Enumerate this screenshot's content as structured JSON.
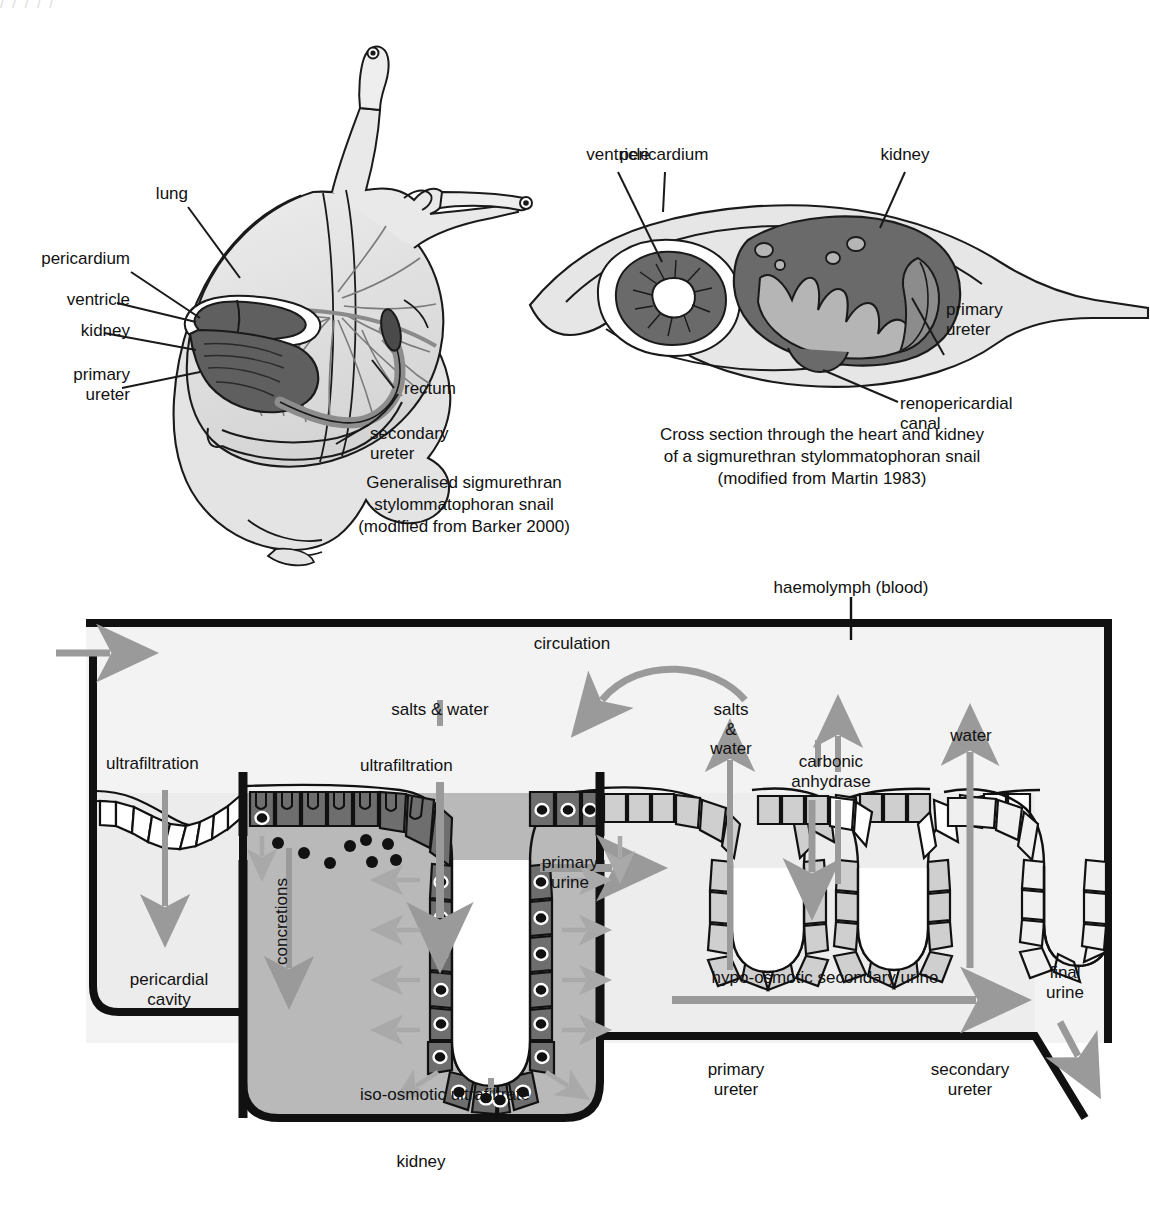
{
  "figure": {
    "title_fragment_top": "/ / / / /"
  },
  "panel_a": {
    "name": "Generalised sigmurethran stylommatophoran snail",
    "caption": "Generalised sigmurethran\nstylommatophoran snail\n(modified from Barker 2000)",
    "labels": {
      "lung": "lung",
      "pericardium": "pericardium",
      "ventricle": "ventricle",
      "kidney": "kidney",
      "primary_ureter": "primary\nureter",
      "rectum": "rectum",
      "secondary_ureter": "secondary\nureter"
    }
  },
  "panel_b": {
    "name": "Cross section through the heart and kidney",
    "caption": "Cross section through the heart and kidney\nof a sigmurethran stylommatophoran snail\n(modified from Martin 1983)",
    "labels": {
      "ventricle": "ventricle",
      "pericardium": "pericardium",
      "kidney": "kidney",
      "primary_ureter": "primary\nureter",
      "renopericardial_canal": "renopericardial\ncanal"
    }
  },
  "panel_c": {
    "name": "Urine formation schematic",
    "labels": {
      "haemolymph": "haemolymph (blood)",
      "circulation": "circulation",
      "salts_and_water_left": "salts & water",
      "ultrafiltration_left": "ultrafiltration",
      "ultrafiltration_mid": "ultrafiltration",
      "salts_and_water_right": "salts\n&\nwater",
      "carbonic_anhydrase": "carbonic\nanhydrase",
      "water": "water",
      "concretions": "concretions",
      "primary_urine": "primary\nurine",
      "pericardial_cavity": "pericardial\ncavity",
      "iso_osmotic_ultrafiltrate": "iso-osmotic ultrafiltrate",
      "kidney": "kidney",
      "hypo_osmotic_secondary_urine": "hypo-osmotic secondary urine",
      "final_urine": "final\nurine",
      "primary_ureter": "primary\nureter",
      "secondary_ureter": "secondary\nureter"
    }
  },
  "colors": {
    "ink": "#111111",
    "arrow_gray": "#9a9a9a",
    "tissue_dark": "#6e6e6e",
    "tissue_mid": "#b5b5b5",
    "tissue_light": "#d6d6d6",
    "cavity_light": "#ececec",
    "body_pale": "#e2e2e2",
    "white": "#ffffff"
  }
}
